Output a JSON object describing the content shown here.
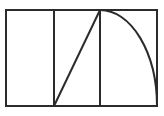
{
  "figure": {
    "background_color": "#ffffff",
    "stroke_color": "#2b2b2b",
    "stroke_width": 2,
    "canvas": {
      "width": 164,
      "height": 116
    }
  },
  "chart_data": {
    "type": "diagram",
    "xlabel": "",
    "ylabel": "",
    "xlim": [
      0,
      164
    ],
    "ylim": [
      0,
      116
    ],
    "grid": false,
    "legend": "none",
    "shapes": [
      {
        "name": "outer-rectangle",
        "kind": "rect",
        "x": 6,
        "y": 10,
        "width": 151,
        "height": 96,
        "points": [
          [
            6,
            10
          ],
          [
            157,
            10
          ],
          [
            157,
            106
          ],
          [
            6,
            106
          ]
        ],
        "stroke": "#2b2b2b",
        "stroke_width": 2,
        "fill": "none"
      },
      {
        "name": "vertical-divider-left",
        "kind": "line",
        "x1": 54,
        "y1": 10,
        "x2": 54,
        "y2": 106,
        "stroke": "#2b2b2b",
        "stroke_width": 2
      },
      {
        "name": "vertical-divider-right",
        "kind": "line",
        "x1": 100,
        "y1": 10,
        "x2": 100,
        "y2": 106,
        "stroke": "#2b2b2b",
        "stroke_width": 2
      },
      {
        "name": "diagonal-hypotenuse",
        "kind": "line",
        "x1": 54,
        "y1": 106,
        "x2": 100,
        "y2": 10,
        "stroke": "#2b2b2b",
        "stroke_width": 2
      },
      {
        "name": "elliptical-arc",
        "kind": "arc",
        "center": [
          100,
          106
        ],
        "radius_x": 57,
        "radius_y": 96,
        "start_point": [
          100,
          10
        ],
        "end_point": [
          157,
          106
        ],
        "sweep": "clockwise",
        "path": "M 100 10 A 57 96 0 0 1 157 106",
        "stroke": "#2b2b2b",
        "stroke_width": 2,
        "fill": "none"
      }
    ],
    "vertices": [
      {
        "name": "top-left-corner",
        "x": 6,
        "y": 10
      },
      {
        "name": "top-right-corner",
        "x": 157,
        "y": 10
      },
      {
        "name": "bottom-right-corner",
        "x": 157,
        "y": 106
      },
      {
        "name": "bottom-left-corner",
        "x": 6,
        "y": 106
      },
      {
        "name": "apex-point",
        "x": 100,
        "y": 10
      },
      {
        "name": "diagonal-base-point",
        "x": 54,
        "y": 106
      }
    ],
    "annotations": []
  }
}
